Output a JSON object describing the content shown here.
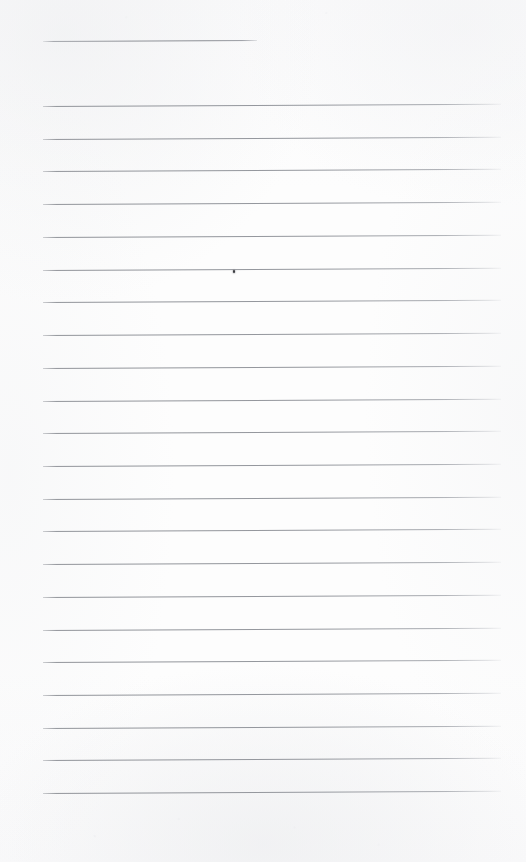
{
  "document": {
    "kind": "scanned-lined-notebook-page",
    "page_width": 526,
    "page_height": 862,
    "background_color": "#fcfcfc",
    "rule_color": "#93969c",
    "ink_color": "#3b3c40",
    "text_content": "",
    "caption": ""
  },
  "title_rule": {
    "name": "title-rule",
    "x": 43,
    "y": 41,
    "width": 214,
    "tilt_deg": -0.25
  },
  "ruled_lines": {
    "left_x": 43,
    "right_x": 501,
    "width": 458,
    "first_y": 106,
    "spacing": 32.72,
    "count": 22,
    "tilt_deg": -0.28,
    "y_positions": [
      106.0,
      138.7,
      171.4,
      204.2,
      236.9,
      269.6,
      302.3,
      335.0,
      367.8,
      400.5,
      433.2,
      465.9,
      498.6,
      531.4,
      564.1,
      596.8,
      629.5,
      662.2,
      695.0,
      727.7,
      760.4,
      793.1
    ]
  },
  "ink_marks": [
    {
      "name": "ink-dot-mark",
      "x": 233,
      "y": 270,
      "on_line_index": 5,
      "description": "small dark ink dot resting on the sixth ruled line"
    }
  ]
}
